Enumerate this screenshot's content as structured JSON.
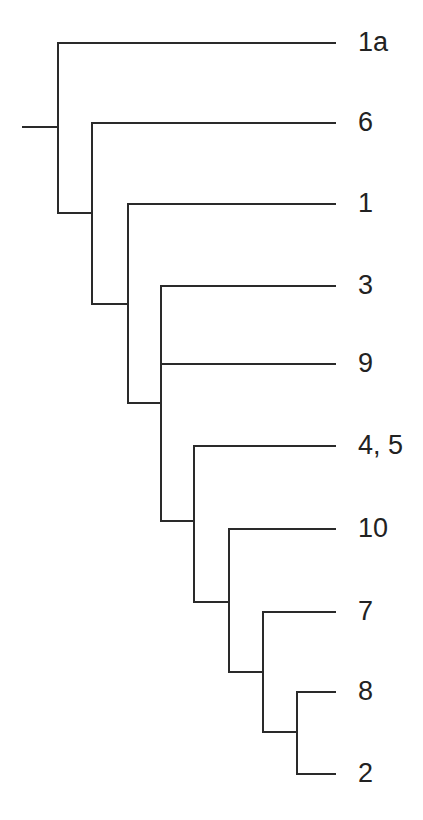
{
  "diagram": {
    "type": "phylogenetic-tree",
    "line_color": "#2a2a2a",
    "label_color": "#222222",
    "root": {
      "x1": 23,
      "x2": 58,
      "y": 127
    },
    "nodes": [
      {
        "id": "n1",
        "x": 58,
        "y_top": 43,
        "y_bottom": 213,
        "parent_y": 127
      },
      {
        "id": "n2",
        "x": 92,
        "y_top": 123,
        "y_bottom": 304,
        "parent_x": 58,
        "parent_y": 213
      },
      {
        "id": "n3",
        "x": 128,
        "y_top": 204,
        "y_bottom": 403,
        "parent_x": 92,
        "parent_y": 304
      },
      {
        "id": "n4",
        "x": 161,
        "y_top": 286,
        "y_bottom": 521,
        "parent_x": 128,
        "parent_y": 403
      },
      {
        "id": "n5",
        "x": 194,
        "y_top": 446,
        "y_bottom": 602,
        "parent_x": 161,
        "parent_y": 521
      },
      {
        "id": "n6",
        "x": 229,
        "y_top": 529,
        "y_bottom": 672,
        "parent_x": 194,
        "parent_y": 602
      },
      {
        "id": "n7",
        "x": 263,
        "y_top": 612,
        "y_bottom": 732,
        "parent_x": 229,
        "parent_y": 672
      },
      {
        "id": "n8",
        "x": 297,
        "y_top": 692,
        "y_bottom": 774,
        "parent_x": 263,
        "parent_y": 732
      }
    ],
    "leaves": [
      {
        "label": "1a",
        "from_x": 58,
        "y": 43
      },
      {
        "label": "6",
        "from_x": 92,
        "y": 123
      },
      {
        "label": "1",
        "from_x": 128,
        "y": 204
      },
      {
        "label": "3",
        "from_x": 161,
        "y": 286
      },
      {
        "label": "9",
        "from_x": 161,
        "y": 364
      },
      {
        "label": "4, 5",
        "from_x": 194,
        "y": 446
      },
      {
        "label": "10",
        "from_x": 229,
        "y": 529
      },
      {
        "label": "7",
        "from_x": 263,
        "y": 612
      },
      {
        "label": "8",
        "from_x": 297,
        "y": 692
      },
      {
        "label": "2",
        "from_x": 297,
        "y": 774
      }
    ],
    "leaf_end_x": 335,
    "label_x": 358
  }
}
